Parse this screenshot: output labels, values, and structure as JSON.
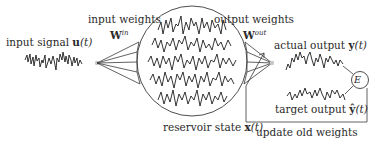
{
  "diagram": {
    "type": "echo-state-network-schematic",
    "labels": {
      "input_signal": "input signal",
      "input_signal_symbol": "u",
      "input_signal_arg": "(t)",
      "input_weights": "input weights",
      "input_weights_symbol": "W",
      "input_weights_sup": "in",
      "output_weights": "output weights",
      "output_weights_symbol": "W",
      "output_weights_sup": "out",
      "reservoir_state": "reservoir state",
      "reservoir_state_symbol": "x",
      "reservoir_state_arg": "(t)",
      "actual_output": "actual output",
      "actual_output_symbol": "y",
      "actual_output_arg": "(t)",
      "target_output": "target output",
      "target_output_symbol": "ŷ",
      "target_output_arg": "(t)",
      "error_node": "E",
      "feedback": "update old weights"
    },
    "nodes": [
      {
        "id": "input",
        "label": "input signal u(t)"
      },
      {
        "id": "reservoir",
        "label": "reservoir state x(t)"
      },
      {
        "id": "output",
        "label": "actual output y(t)"
      },
      {
        "id": "target",
        "label": "target output ŷ(t)"
      },
      {
        "id": "error",
        "label": "E"
      }
    ],
    "edges": [
      {
        "from": "input",
        "to": "reservoir",
        "label": "input weights W^in"
      },
      {
        "from": "reservoir",
        "to": "output",
        "label": "output weights W^out"
      },
      {
        "from": "output",
        "to": "error"
      },
      {
        "from": "target",
        "to": "error"
      },
      {
        "from": "error",
        "to": "output_weights",
        "label": "update old weights"
      }
    ],
    "colors": {
      "line": "#3a3a3a",
      "signal": "#1e1e1e",
      "node_dot": "#c8c8c8",
      "text": "#2a2a2a"
    }
  }
}
